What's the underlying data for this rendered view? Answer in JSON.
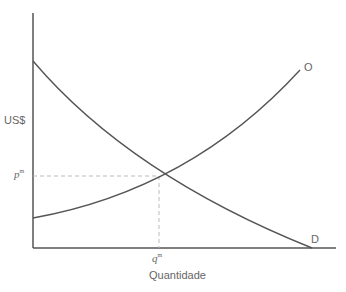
{
  "diagram": {
    "type": "supply-demand",
    "y_axis_label": "US$",
    "x_axis_label": "Quantidade",
    "supply_curve_label": "O",
    "demand_curve_label": "D",
    "equilibrium_price_label": {
      "base": "p",
      "sup": "m"
    },
    "equilibrium_quantity_label": {
      "base": "q",
      "sup": "m"
    },
    "colors": {
      "axis": "#555555",
      "curve": "#555555",
      "guide": "#bbbbbb",
      "text": "#666666"
    }
  }
}
